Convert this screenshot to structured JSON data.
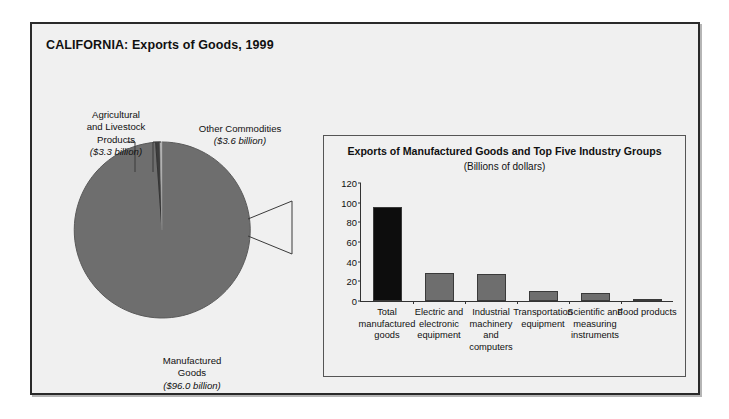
{
  "figure": {
    "title": "CALIFORNIA: Exports of Goods, 1999",
    "background_color": "#f0f0f0",
    "border_color": "#2a2a2a"
  },
  "pie": {
    "slices": [
      {
        "name": "manufactured-goods",
        "label_line1": "Manufactured",
        "label_line2": "Goods",
        "value_label": "($96.0 billion)",
        "value": 96.0,
        "color": "#6e6e6e"
      },
      {
        "name": "agricultural-and-livestock-products",
        "label_line1": "Agricultural",
        "label_line2": "and Livestock",
        "label_line3": "Products",
        "value_label": "($3.3 billion)",
        "value": 3.3,
        "color": "#3d3d3d"
      },
      {
        "name": "other-commodities",
        "label_line1": "Other Commodities",
        "value_label": "($3.6 billion)",
        "value": 3.6,
        "color": "#c2c2c2"
      }
    ]
  },
  "inset": {
    "title": "Exports of Manufactured Goods and Top Five Industry Groups",
    "subtitle": "(Billions of dollars)"
  },
  "chart_data": {
    "type": "bar",
    "title": "Exports of Manufactured Goods and Top Five Industry Groups",
    "subtitle": "(Billions of dollars)",
    "xlabel": "",
    "ylabel": "",
    "ylim": [
      0,
      120
    ],
    "yticks": [
      0,
      20,
      40,
      60,
      80,
      100,
      120
    ],
    "grid": false,
    "legend": "none",
    "categories": [
      "Total manufactured goods",
      "Electric and electronic equipment",
      "Industrial machinery and computers",
      "Transportation equipment",
      "Scientific and measuring instruments",
      "Food products"
    ],
    "category_lines": [
      [
        "Total",
        "manufactured",
        "goods"
      ],
      [
        "Electric and",
        "electronic",
        "equipment"
      ],
      [
        "Industrial",
        "machinery",
        "and",
        "computers"
      ],
      [
        "Transportation",
        "equipment"
      ],
      [
        "Scientific and",
        "measuring",
        "instruments"
      ],
      [
        "Food products"
      ]
    ],
    "values": [
      96.0,
      28.0,
      27.0,
      10.0,
      8.0,
      2.5
    ],
    "bar_colors": [
      "#0d0d0d",
      "#6e6e6e",
      "#6e6e6e",
      "#6e6e6e",
      "#6e6e6e",
      "#6e6e6e"
    ]
  },
  "pie_chart_data": {
    "type": "pie",
    "title": "CALIFORNIA: Exports of Goods, 1999",
    "labels": [
      "Manufactured Goods",
      "Agricultural and Livestock Products",
      "Other Commodities"
    ],
    "values": [
      96.0,
      3.3,
      3.6
    ],
    "unit": "billions of dollars",
    "colors": [
      "#6e6e6e",
      "#3d3d3d",
      "#c2c2c2"
    ]
  }
}
